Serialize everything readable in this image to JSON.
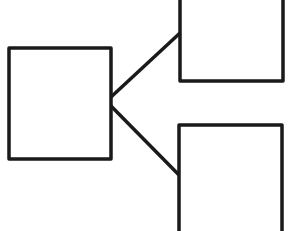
{
  "diagram": {
    "type": "tree-branch",
    "stroke_color": "#1a1a1a",
    "background": "#ffffff",
    "nodes": [
      {
        "id": "root",
        "label": "",
        "x": 9,
        "y": 48,
        "w": 102,
        "h": 111
      },
      {
        "id": "child-top",
        "label": "",
        "x": 180,
        "y": -10,
        "w": 103,
        "h": 91
      },
      {
        "id": "child-bottom",
        "label": "",
        "x": 179,
        "y": 125,
        "w": 103,
        "h": 120
      }
    ],
    "edges": [
      {
        "from": "root",
        "to": "child-top",
        "x1": 111,
        "y1": 97,
        "x2": 180,
        "y2": 33
      },
      {
        "from": "root",
        "to": "child-bottom",
        "x1": 111,
        "y1": 106,
        "x2": 179,
        "y2": 175
      }
    ]
  }
}
